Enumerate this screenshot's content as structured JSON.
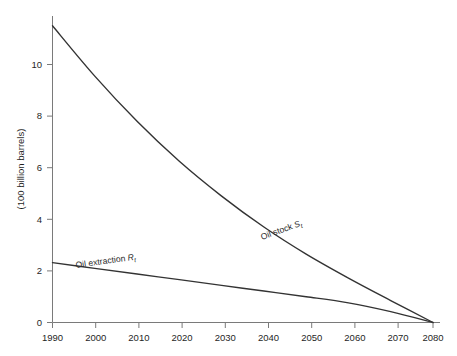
{
  "chart_data": {
    "type": "line",
    "title": "",
    "xlabel": "",
    "ylabel": "(100 billion barrels)",
    "xlim": [
      1990,
      2080
    ],
    "ylim": [
      0,
      11.5
    ],
    "grid": false,
    "legend_position": "inline-labels",
    "x_ticks": [
      "1990",
      "2000",
      "2010",
      "2020",
      "2030",
      "2040",
      "2050",
      "2060",
      "2070",
      "2080"
    ],
    "y_ticks": [
      "0",
      "2",
      "4",
      "6",
      "8",
      "10"
    ],
    "x": [
      1990,
      2000,
      2010,
      2020,
      2030,
      2040,
      2050,
      2060,
      2070,
      2080
    ],
    "series": [
      {
        "name": "Oil stock S_t",
        "label_text": "Oil stock ",
        "label_symbol": "S",
        "label_subscript": "t",
        "color": "#333333",
        "values": [
          11.5,
          9.55,
          7.8,
          6.25,
          4.9,
          3.7,
          2.65,
          1.72,
          0.85,
          0.0
        ]
      },
      {
        "name": "Oil extraction R_t",
        "label_text": "Oil extraction ",
        "label_symbol": "R",
        "label_subscript": "t",
        "color": "#333333",
        "values": [
          2.32,
          2.1,
          1.88,
          1.66,
          1.44,
          1.22,
          1.0,
          0.76,
          0.42,
          0.0
        ]
      }
    ],
    "axis_color": "#7a7a7a"
  }
}
